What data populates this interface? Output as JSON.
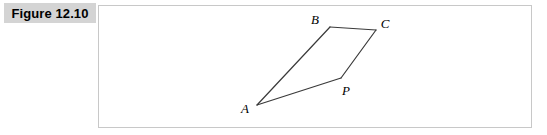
{
  "figure": {
    "caption_label": "Figure 12.10",
    "caption_background_color": "#d4d4d4",
    "panel_border_color": "#c8c8c8",
    "panel_background_color": "#ffffff",
    "stroke_color": "#3a3a3a"
  },
  "diagram_data": {
    "type": "geometric-figure",
    "shape": "quadrilateral",
    "description": "Quadrilateral A B C P with vertices labeled A, B, C, P",
    "vertices": [
      {
        "name": "A",
        "label": "A",
        "x": 158,
        "y": 99,
        "label_x": 146,
        "label_y": 107
      },
      {
        "name": "B",
        "label": "B",
        "x": 231,
        "y": 21,
        "label_x": 216,
        "label_y": 18
      },
      {
        "name": "C",
        "label": "C",
        "x": 277,
        "y": 24,
        "label_x": 286,
        "label_y": 22
      },
      {
        "name": "P",
        "label": "P",
        "x": 242,
        "y": 72,
        "label_x": 247,
        "label_y": 89
      }
    ],
    "edges": [
      {
        "name": "segment-AB",
        "from": "A",
        "to": "B"
      },
      {
        "name": "segment-BC",
        "from": "B",
        "to": "C"
      },
      {
        "name": "segment-CP",
        "from": "C",
        "to": "P"
      },
      {
        "name": "segment-PA",
        "from": "P",
        "to": "A"
      }
    ]
  }
}
